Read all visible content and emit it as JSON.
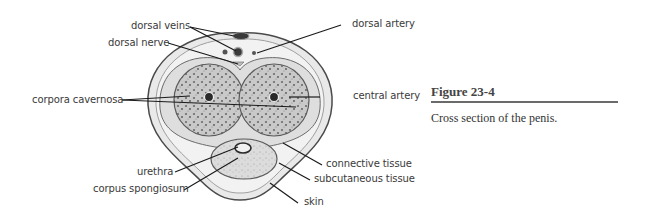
{
  "figure": {
    "number": "Figure 23-4",
    "caption": "Cross section of the penis."
  },
  "labels": {
    "dorsal_veins": "dorsal veins",
    "dorsal_nerve": "dorsal nerve",
    "dorsal_artery": "dorsal artery",
    "corpora_cavernosa": "corpora cavernosa",
    "central_artery": "central artery",
    "urethra": "urethra",
    "corpus_spongiosum": "corpus spongiosum",
    "connective_tissue": "connective tissue",
    "subcutaneous_tissue": "subcutaneous tissue",
    "skin": "skin"
  },
  "colors": {
    "line": "#1a1a1a",
    "tissue_fill": "#e6e6e6",
    "cavernosa_fill": "#b8b8b8",
    "outline": "#555555"
  }
}
